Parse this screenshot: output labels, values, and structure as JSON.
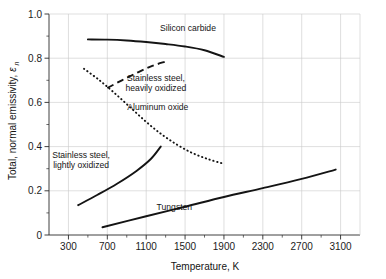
{
  "chart_data": {
    "type": "line",
    "title": "",
    "xlabel": "Temperature, K",
    "ylabel": "Total, normal emissivity,",
    "ylabel_symbol": "ε",
    "ylabel_subscript": "n",
    "xlim": [
      100,
      3300
    ],
    "ylim": [
      0,
      1.0
    ],
    "xticks": [
      300,
      700,
      1100,
      1500,
      1900,
      2300,
      2700,
      3100
    ],
    "xticklabels": [
      "300",
      "700",
      "1100",
      "1500",
      "1900",
      "2300",
      "2700",
      "3100"
    ],
    "xminorticks": [
      500,
      900,
      1300,
      1700,
      2100,
      2500,
      2900
    ],
    "yticks": [
      0,
      0.2,
      0.4,
      0.6,
      0.8,
      1.0
    ],
    "yticklabels": [
      "0",
      "0.2",
      "0.4",
      "0.6",
      "0.8",
      "1.0"
    ],
    "yminorticks": [
      0.1,
      0.3,
      0.5,
      0.7,
      0.9
    ],
    "grid": true,
    "legend": "inline-annotations",
    "series": [
      {
        "name": "Silicon carbide",
        "style": "solid",
        "label": "Silicon carbide",
        "label_x": 1530,
        "label_y": 0.925,
        "points": [
          [
            500,
            0.885
          ],
          [
            700,
            0.884
          ],
          [
            900,
            0.88
          ],
          [
            1100,
            0.873
          ],
          [
            1300,
            0.864
          ],
          [
            1500,
            0.853
          ],
          [
            1700,
            0.836
          ],
          [
            1900,
            0.806
          ]
        ]
      },
      {
        "name": "Stainless steel, heavily oxidized",
        "style": "dashed",
        "label": "Stainless steel,",
        "label2": "heavily oxidized",
        "label_x": 1200,
        "label_y": 0.695,
        "points": [
          [
            700,
            0.665
          ],
          [
            850,
            0.7
          ],
          [
            1000,
            0.733
          ],
          [
            1150,
            0.763
          ],
          [
            1300,
            0.785
          ]
        ]
      },
      {
        "name": "Aluminum oxide",
        "style": "dotted",
        "label": "Aluminum oxide",
        "label_x": 1220,
        "label_y": 0.565,
        "points": [
          [
            460,
            0.752
          ],
          [
            620,
            0.7
          ],
          [
            780,
            0.64
          ],
          [
            940,
            0.576
          ],
          [
            1100,
            0.512
          ],
          [
            1260,
            0.455
          ],
          [
            1420,
            0.408
          ],
          [
            1580,
            0.37
          ],
          [
            1740,
            0.343
          ],
          [
            1900,
            0.322
          ]
        ]
      },
      {
        "name": "Stainless steel, lightly oxidized",
        "style": "solid",
        "label": "Stainless steel,",
        "label2": "lightly oxidized",
        "label_x": 430,
        "label_y": 0.35,
        "points": [
          [
            400,
            0.135
          ],
          [
            600,
            0.182
          ],
          [
            800,
            0.232
          ],
          [
            1000,
            0.29
          ],
          [
            1150,
            0.345
          ],
          [
            1250,
            0.4
          ]
        ]
      },
      {
        "name": "Tungsten",
        "style": "solid",
        "label": "Tungsten",
        "label_x": 1390,
        "label_y": 0.115,
        "points": [
          [
            650,
            0.035
          ],
          [
            1100,
            0.085
          ],
          [
            1500,
            0.128
          ],
          [
            1900,
            0.172
          ],
          [
            2300,
            0.212
          ],
          [
            2700,
            0.254
          ],
          [
            3050,
            0.296
          ]
        ]
      }
    ]
  }
}
